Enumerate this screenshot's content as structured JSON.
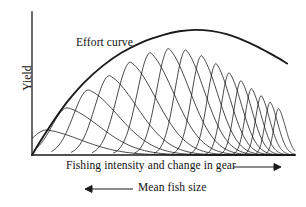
{
  "figure": {
    "kind": "line-diagram",
    "background_color": "#ffffff",
    "ink_color": "#1a1a1a",
    "width": 306,
    "height": 207
  },
  "axes": {
    "y_label": "Yield",
    "x_label": "Fishing intensity and change in gear",
    "secondary_x_label": "Mean fish size",
    "x_arrow_direction": "right",
    "secondary_x_arrow_direction": "left",
    "origin": {
      "x": 32,
      "y": 155
    },
    "x_end": 295,
    "y_top": 12,
    "ticks": false,
    "gridlines": false
  },
  "annotations": [
    {
      "name": "effort-curve-label",
      "text": "Effort curve",
      "x": 76,
      "y": 36
    }
  ],
  "chart_data": {
    "type": "line",
    "title": "",
    "xlabel": "Fishing intensity and change in gear",
    "ylabel": "Yield",
    "secondary_xlabel": "Mean fish size",
    "xlim": [
      0,
      1
    ],
    "ylim": [
      0,
      1
    ],
    "grid": false,
    "legend": "none",
    "series": [
      {
        "name": "Effort curve",
        "role": "envelope",
        "stroke_width": 1.9,
        "points": [
          [
            0.0,
            0.0
          ],
          [
            0.04,
            0.12
          ],
          [
            0.09,
            0.26
          ],
          [
            0.14,
            0.385
          ],
          [
            0.2,
            0.51
          ],
          [
            0.27,
            0.625
          ],
          [
            0.34,
            0.715
          ],
          [
            0.42,
            0.79
          ],
          [
            0.5,
            0.84
          ],
          [
            0.56,
            0.865
          ],
          [
            0.62,
            0.875
          ],
          [
            0.68,
            0.868
          ],
          [
            0.74,
            0.845
          ],
          [
            0.8,
            0.805
          ],
          [
            0.86,
            0.755
          ],
          [
            0.92,
            0.695
          ],
          [
            0.97,
            0.64
          ]
        ]
      },
      {
        "name": "cohort-yield-curves",
        "role": "cohorts",
        "stroke_width": 0.8,
        "description": "Successive skewed yield-per-recruit curves; each rises steeply to a peak then decays with a long right tail. Peaks follow the effort curve envelope while widths and heights shrink to the right.",
        "count": 16,
        "cohorts": [
          {
            "peak_x": 0.055,
            "peak_y": 0.175,
            "start_x": 0.0,
            "rise": 0.06,
            "decay": 0.23
          },
          {
            "peak_x": 0.135,
            "peak_y": 0.33,
            "start_x": 0.02,
            "rise": 0.06,
            "decay": 0.215
          },
          {
            "peak_x": 0.215,
            "peak_y": 0.455,
            "start_x": 0.075,
            "rise": 0.058,
            "decay": 0.2
          },
          {
            "peak_x": 0.295,
            "peak_y": 0.555,
            "start_x": 0.15,
            "rise": 0.056,
            "decay": 0.185
          },
          {
            "peak_x": 0.375,
            "peak_y": 0.65,
            "start_x": 0.23,
            "rise": 0.054,
            "decay": 0.172
          },
          {
            "peak_x": 0.45,
            "peak_y": 0.715,
            "start_x": 0.31,
            "rise": 0.05,
            "decay": 0.158
          },
          {
            "peak_x": 0.52,
            "peak_y": 0.745,
            "start_x": 0.39,
            "rise": 0.046,
            "decay": 0.142
          },
          {
            "peak_x": 0.585,
            "peak_y": 0.735,
            "start_x": 0.465,
            "rise": 0.042,
            "decay": 0.126
          },
          {
            "peak_x": 0.645,
            "peak_y": 0.695,
            "start_x": 0.535,
            "rise": 0.038,
            "decay": 0.11
          },
          {
            "peak_x": 0.7,
            "peak_y": 0.64,
            "start_x": 0.6,
            "rise": 0.034,
            "decay": 0.096
          },
          {
            "peak_x": 0.75,
            "peak_y": 0.575,
            "start_x": 0.66,
            "rise": 0.03,
            "decay": 0.084
          },
          {
            "peak_x": 0.795,
            "peak_y": 0.52,
            "start_x": 0.715,
            "rise": 0.027,
            "decay": 0.073
          },
          {
            "peak_x": 0.835,
            "peak_y": 0.465,
            "start_x": 0.765,
            "rise": 0.024,
            "decay": 0.064
          },
          {
            "peak_x": 0.872,
            "peak_y": 0.415,
            "start_x": 0.81,
            "rise": 0.022,
            "decay": 0.056
          },
          {
            "peak_x": 0.906,
            "peak_y": 0.37,
            "start_x": 0.852,
            "rise": 0.02,
            "decay": 0.05
          },
          {
            "peak_x": 0.938,
            "peak_y": 0.325,
            "start_x": 0.89,
            "rise": 0.018,
            "decay": 0.045
          }
        ]
      }
    ]
  }
}
